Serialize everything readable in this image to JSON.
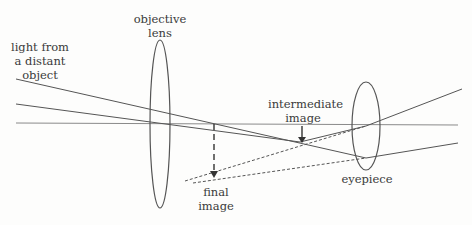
{
  "labels": {
    "light": [
      "light from",
      "a distant",
      "object"
    ],
    "objective": [
      "objective",
      "lens"
    ],
    "intermediate": [
      "intermediate",
      "image"
    ],
    "eyepiece": "eyepiece",
    "final": [
      "final",
      "image"
    ]
  },
  "colors": {
    "line": "#555555",
    "axis": "#8a8a8a"
  }
}
